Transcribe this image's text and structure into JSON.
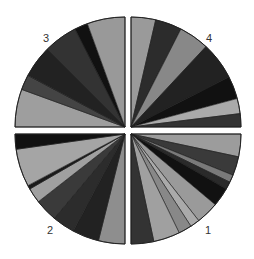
{
  "chart_data": {
    "type": "pie",
    "title": "",
    "layout": {
      "width": 254,
      "height": 259,
      "radius": 110,
      "quadrant_gap_px": 6,
      "angle_convention": "degrees clockwise from 3 o'clock"
    },
    "quadrants": [
      {
        "label": "1",
        "label_pos": [
          205,
          233
        ],
        "center": [
          131,
          134
        ],
        "wedges": [
          {
            "start": 0,
            "end": 12,
            "color": "#9c9c9c"
          },
          {
            "start": 12,
            "end": 22,
            "color": "#3a3a3a"
          },
          {
            "start": 22,
            "end": 26,
            "color": "#7a7a7a"
          },
          {
            "start": 26,
            "end": 30,
            "color": "#2a2a2a"
          },
          {
            "start": 30,
            "end": 40,
            "color": "#111111"
          },
          {
            "start": 40,
            "end": 52,
            "color": "#9a9a9a"
          },
          {
            "start": 52,
            "end": 57,
            "color": "#aaaaaa"
          },
          {
            "start": 57,
            "end": 64,
            "color": "#888888"
          },
          {
            "start": 64,
            "end": 78,
            "color": "#a0a0a0"
          },
          {
            "start": 78,
            "end": 90,
            "color": "#333333"
          }
        ]
      },
      {
        "label": "2",
        "label_pos": [
          47,
          233
        ],
        "center": [
          125,
          134
        ],
        "wedges": [
          {
            "start": 90,
            "end": 104,
            "color": "#8e8e8e"
          },
          {
            "start": 104,
            "end": 118,
            "color": "#222222"
          },
          {
            "start": 118,
            "end": 130,
            "color": "#2c2c2c"
          },
          {
            "start": 130,
            "end": 142,
            "color": "#3a3a3a"
          },
          {
            "start": 142,
            "end": 150,
            "color": "#a0a0a0"
          },
          {
            "start": 150,
            "end": 152,
            "color": "#1a1a1a"
          },
          {
            "start": 152,
            "end": 172,
            "color": "#a5a5a5"
          },
          {
            "start": 172,
            "end": 180,
            "color": "#111111"
          }
        ]
      },
      {
        "label": "3",
        "label_pos": [
          43,
          43
        ],
        "center": [
          125,
          127
        ],
        "wedges": [
          {
            "start": 180,
            "end": 200,
            "color": "#9e9e9e"
          },
          {
            "start": 200,
            "end": 208,
            "color": "#444444"
          },
          {
            "start": 208,
            "end": 225,
            "color": "#222222"
          },
          {
            "start": 225,
            "end": 243,
            "color": "#333333"
          },
          {
            "start": 243,
            "end": 250,
            "color": "#111111"
          },
          {
            "start": 250,
            "end": 270,
            "color": "#999999"
          }
        ]
      },
      {
        "label": "4",
        "label_pos": [
          206,
          43
        ],
        "center": [
          131,
          127
        ],
        "wedges": [
          {
            "start": 270,
            "end": 283,
            "color": "#9a9a9a"
          },
          {
            "start": 283,
            "end": 297,
            "color": "#2c2c2c"
          },
          {
            "start": 297,
            "end": 313,
            "color": "#888888"
          },
          {
            "start": 313,
            "end": 333,
            "color": "#222222"
          },
          {
            "start": 333,
            "end": 345,
            "color": "#111111"
          },
          {
            "start": 345,
            "end": 353,
            "color": "#aaaaaa"
          },
          {
            "start": 353,
            "end": 360,
            "color": "#333333"
          }
        ]
      }
    ],
    "legend": "none",
    "grid": false
  }
}
